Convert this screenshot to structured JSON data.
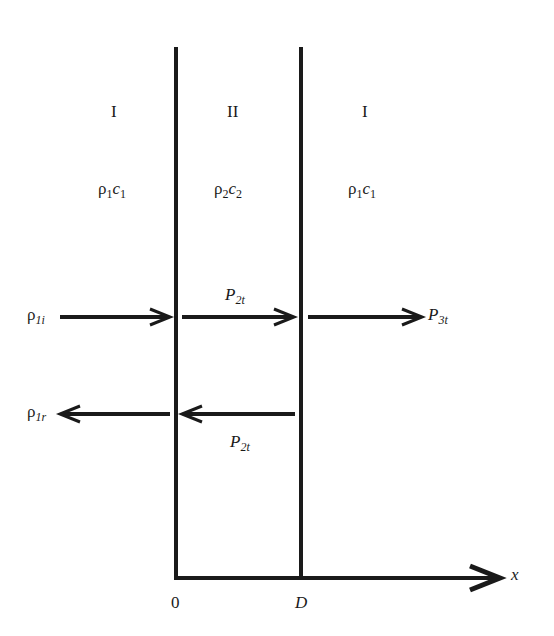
{
  "regions": [
    {
      "id": "left",
      "label": "I",
      "rho": "ρ",
      "rho_sub": "1",
      "c": "c",
      "c_sub": "1"
    },
    {
      "id": "middle",
      "label": "II",
      "rho": "ρ",
      "rho_sub": "2",
      "c": "c",
      "c_sub": "2"
    },
    {
      "id": "right",
      "label": "I",
      "rho": "ρ",
      "rho_sub": "1",
      "c": "c",
      "c_sub": "1"
    }
  ],
  "waves": {
    "incident": {
      "sym": "ρ",
      "sub": "1i"
    },
    "reflected": {
      "sym": "ρ",
      "sub": "1r"
    },
    "transmitted_forward": {
      "sym": "P",
      "sub": "2t"
    },
    "transmitted_backward": {
      "sym": "P",
      "sub": "2t"
    },
    "transmitted_out": {
      "sym": "P",
      "sub": "3t"
    }
  },
  "axis": {
    "label": "x",
    "origin_label": "0",
    "boundary_label": "D"
  },
  "colors": {
    "ink": "#1a1a1a",
    "background": "#ffffff"
  }
}
